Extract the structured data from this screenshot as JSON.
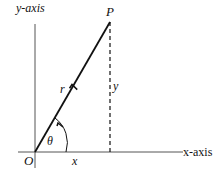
{
  "diagram": {
    "type": "polar-coordinates",
    "labels": {
      "y_axis": "y-axis",
      "x_axis": "x-axis",
      "point": "P",
      "origin": "O",
      "radius": "r",
      "angle": "θ",
      "x_component": "x",
      "y_component": "y"
    },
    "colors": {
      "line": "#111111",
      "axis": "#555555",
      "background": "#ffffff"
    }
  }
}
